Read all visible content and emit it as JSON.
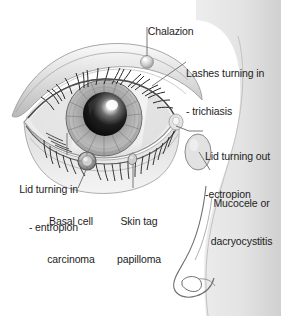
{
  "diagram": {
    "style": "grayscale pencil-shaded medical illustration",
    "colors": {
      "background": "#ffffff",
      "ink": "#1d1d1d",
      "leader_line": "#6b6b6b",
      "skin_light": "#e9e9e9",
      "skin_mid": "#d2d2d2",
      "skin_shadow": "#b4b4b4",
      "sclera": "#f2f2f2",
      "iris_light": "#bdbdbd",
      "iris_dark": "#8a8a8a",
      "pupil": "#141414",
      "highlight": "#ffffff",
      "lash": "#2b2b2b"
    }
  },
  "labels": [
    {
      "id": "chalazion",
      "text": "Chalazion",
      "lines": [
        "Chalazion"
      ],
      "align": "center",
      "x": 128,
      "y": 12,
      "width": 74,
      "leader": {
        "x1": 147,
        "y1": 27,
        "x2": 147,
        "y2": 56
      },
      "marker": {
        "x": 147,
        "y": 62,
        "shape": "round-bump"
      }
    },
    {
      "id": "trichiasis",
      "text": "Lashes turning in - trichiasis",
      "lines": [
        "Lashes turning in",
        "- trichiasis"
      ],
      "align": "left",
      "x": 186,
      "y": 42,
      "width": 95,
      "leader": {
        "x1": 186,
        "y1": 62,
        "x2": 152,
        "y2": 86
      },
      "marker": {
        "x": 152,
        "y": 86,
        "shape": "lash-line"
      }
    },
    {
      "id": "ectropion",
      "text": "Lid turning out - ectropion",
      "lines": [
        "Lid turning out",
        "-ectropion"
      ],
      "align": "left",
      "x": 203,
      "y": 126,
      "width": 78,
      "leader": {
        "x1": 203,
        "y1": 131,
        "x2": 188,
        "y2": 131
      },
      "marker": {
        "x": 188,
        "y": 131,
        "shape": "lid-edge"
      }
    },
    {
      "id": "mucocele",
      "text": "Mucocele or dacryocystitis",
      "lines": [
        "Mucocele or",
        "dacryocystitis"
      ],
      "align": "center",
      "x": 202,
      "y": 172,
      "width": 79,
      "leader": {
        "x1": 210,
        "y1": 170,
        "x2": 198,
        "y2": 150
      },
      "marker": {
        "x": 198,
        "y": 150,
        "shape": "oval-swelling"
      }
    },
    {
      "id": "entropion",
      "text": "Lid turning in - entropion",
      "lines": [
        "Lid turning in",
        "- entropion"
      ],
      "align": "right",
      "x": 8,
      "y": 158,
      "width": 70,
      "leader": {
        "x1": 67,
        "y1": 155,
        "x2": 67,
        "y2": 133
      },
      "marker": {
        "x": 67,
        "y": 133,
        "shape": "lid-margin"
      }
    },
    {
      "id": "basal-cell-carcinoma",
      "text": "Basal cell carcinoma",
      "lines": [
        "Basal cell",
        "carcinoma"
      ],
      "align": "center",
      "x": 36,
      "y": 190,
      "width": 70,
      "leader": {
        "x1": 78,
        "y1": 188,
        "x2": 86,
        "y2": 168
      },
      "marker": {
        "x": 87,
        "y": 161,
        "shape": "nodule-ring"
      }
    },
    {
      "id": "skin-tag-papilloma",
      "text": "Skin tag papilloma",
      "lines": [
        "Skin tag",
        "papilloma"
      ],
      "align": "center",
      "x": 107,
      "y": 190,
      "width": 64,
      "leader": {
        "x1": 133,
        "y1": 188,
        "x2": 133,
        "y2": 163
      },
      "marker": {
        "x": 133,
        "y": 160,
        "shape": "teardrop-tag"
      }
    }
  ]
}
